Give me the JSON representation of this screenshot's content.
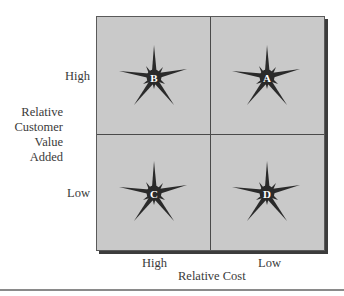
{
  "diagram": {
    "type": "2x2 matrix",
    "y_axis": {
      "label_lines": [
        "Relative",
        "Customer",
        "Value",
        "Added"
      ],
      "ticks": {
        "top": "High",
        "bottom": "Low"
      }
    },
    "x_axis": {
      "label": "Relative Cost",
      "ticks": {
        "left": "High",
        "right": "Low"
      }
    },
    "quadrants": [
      {
        "position": "top-left",
        "letter": "B",
        "customer_value": "High",
        "cost": "High"
      },
      {
        "position": "top-right",
        "letter": "A",
        "customer_value": "High",
        "cost": "Low"
      },
      {
        "position": "bottom-left",
        "letter": "C",
        "customer_value": "Low",
        "cost": "High"
      },
      {
        "position": "bottom-right",
        "letter": "D",
        "customer_value": "Low",
        "cost": "Low"
      }
    ],
    "colors": {
      "grid_fill": "#c9c9c9",
      "grid_lines": "#4a4a4a",
      "shadow": "#3c3c3c",
      "star": "#2a2a2a",
      "star_letter": "#ffffff",
      "text": "#3a3a3a"
    }
  }
}
